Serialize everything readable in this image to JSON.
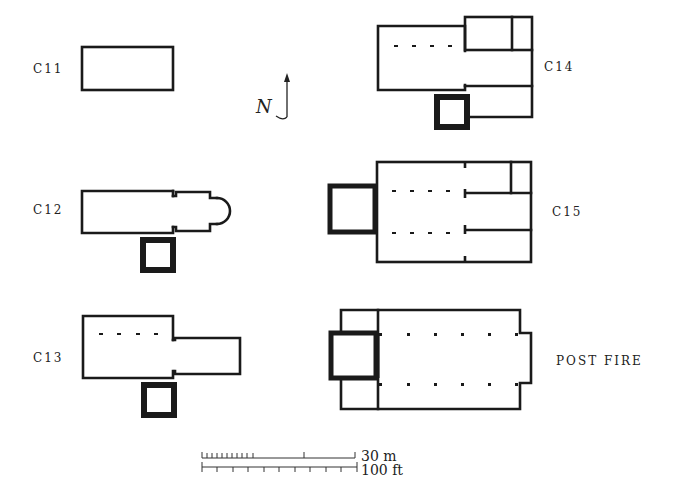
{
  "diagram": {
    "plans": [
      {
        "id": "c11",
        "label": "C11"
      },
      {
        "id": "c12",
        "label": "C12"
      },
      {
        "id": "c13",
        "label": "C13"
      },
      {
        "id": "c14",
        "label": "C14"
      },
      {
        "id": "c15",
        "label": "C15"
      },
      {
        "id": "post-fire",
        "label": "POST FIRE"
      }
    ],
    "north_arrow": {
      "label": "N"
    },
    "scale_bar": {
      "metric_label": "30 m",
      "imperial_label": "100 ft"
    }
  }
}
